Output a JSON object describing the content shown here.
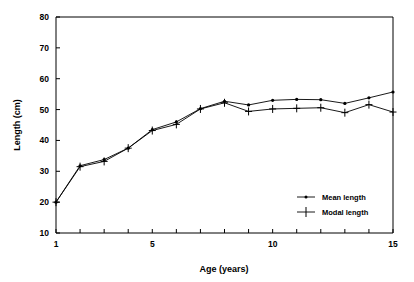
{
  "chart_data": {
    "type": "line",
    "title": "",
    "xlabel": "Age (years)",
    "ylabel": "Length (cm)",
    "xlim": [
      1,
      15
    ],
    "ylim": [
      10,
      80
    ],
    "x": [
      1,
      2,
      3,
      4,
      5,
      6,
      7,
      8,
      9,
      10,
      11,
      12,
      13,
      14,
      15
    ],
    "xticks": [
      1,
      2,
      3,
      4,
      5,
      6,
      7,
      8,
      9,
      10,
      11,
      12,
      13,
      14,
      15
    ],
    "xtick_labels": [
      "1",
      "",
      "",
      "",
      "5",
      "",
      "",
      "",
      "",
      "10",
      "",
      "",
      "",
      "",
      "15"
    ],
    "yticks": [
      10,
      20,
      30,
      40,
      50,
      60,
      70,
      80
    ],
    "ytick_labels": [
      "10",
      "20",
      "30",
      "40",
      "50",
      "60",
      "70",
      "80"
    ],
    "grid": false,
    "legend_position": "lower right",
    "series": [
      {
        "name": "Mean length",
        "marker": "dot",
        "values": [
          20.0,
          31.8,
          33.8,
          37.5,
          43.5,
          46.0,
          50.3,
          52.7,
          51.5,
          53.0,
          53.3,
          53.2,
          52.0,
          53.8,
          55.7
        ]
      },
      {
        "name": "Modal length",
        "marker": "cross",
        "values": [
          20.0,
          31.5,
          33.2,
          37.5,
          43.2,
          45.2,
          50.2,
          52.2,
          49.4,
          50.2,
          50.4,
          50.6,
          49.0,
          51.6,
          49.2
        ]
      }
    ],
    "colors": {
      "line": "#000000",
      "axis": "#000000",
      "background": "#ffffff"
    }
  },
  "legend": {
    "items": [
      {
        "label": "Mean length",
        "marker": "dot"
      },
      {
        "label": "Modal length",
        "marker": "cross"
      }
    ]
  },
  "axes": {
    "x_title": "Age (years)",
    "y_title": "Length (cm)"
  }
}
